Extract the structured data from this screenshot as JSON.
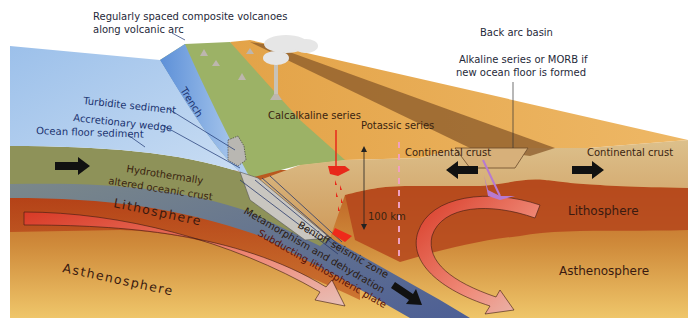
{
  "diagram": {
    "labels": {
      "volcanoes_line1": "Regularly spaced composite volcanoes",
      "volcanoes_line2": "along volcanic arc",
      "back_arc_basin": "Back arc basin",
      "alkaline_line1": "Alkaline series or MORB if",
      "alkaline_line2": "new ocean floor is formed",
      "trench": "Trench",
      "turbidite": "Turbidite sediment",
      "accretionary_wedge": "Accretionary wedge",
      "ocean_floor_sediment": "Ocean floor sediment",
      "calcalkaline": "Calcalkaline series",
      "potassic": "Potassic series",
      "continental_crust_left": "Continental crust",
      "continental_crust_right": "Continental crust",
      "hydro_line1": "Hydrothermally",
      "hydro_line2": "altered oceanic crust",
      "depth": "100 km",
      "lithosphere_left": "Lithosphere",
      "lithosphere_right": "Lithosphere",
      "asthenosphere_left": "Asthenosphere",
      "asthenosphere_right": "Asthenosphere",
      "benioff": "Benioff seismic zone",
      "metamorphism": "Metamorphism and dehydration",
      "subducting_plate": "Subducting lithospheric plate"
    },
    "colors": {
      "ocean": "#8fb4e0",
      "oceanic_crust": "#8c8f5a",
      "continental_surface": "#e8a54a",
      "arc_vegetation": "#9bb264",
      "continental_crust": "#d9b27a",
      "lithosphere": "#b84a1c",
      "asthenosphere": "#d49a45",
      "slab": "#5e6f8c",
      "magma": "#e8281a",
      "arrows": "#111111"
    },
    "icons": [
      "plate-motion-arrow-right",
      "plate-motion-arrow-left",
      "convection-arrow",
      "volcano-icon",
      "eruption-cloud-icon"
    ]
  }
}
